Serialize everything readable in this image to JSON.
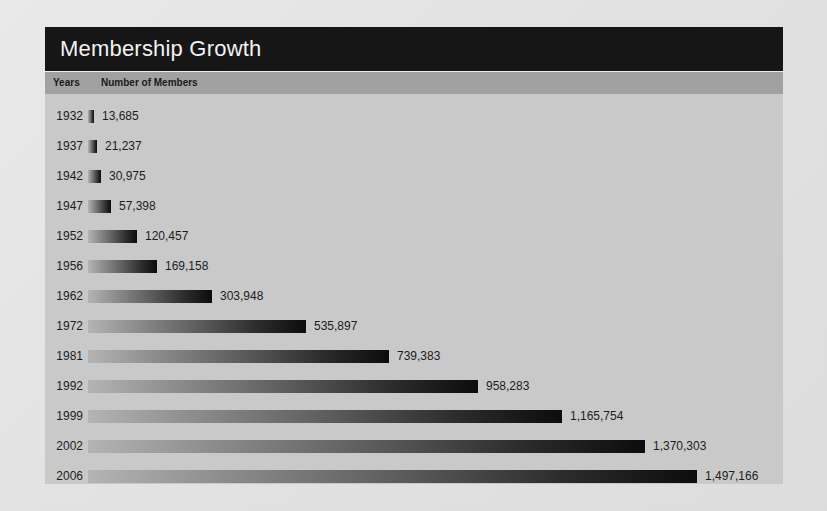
{
  "page": {
    "background_color": "#e6e6e6",
    "panel_color": "#c9c9c9",
    "title_bar_color": "#161616",
    "column_header_color": "#a1a1a1",
    "bar_gradient_start": "#b4b4b4",
    "bar_gradient_end": "#0c0c0c",
    "text_color": "#1c1c1c"
  },
  "header": {
    "title": "Membership Growth"
  },
  "columns": {
    "years": "Years",
    "members": "Number of Members"
  },
  "chart_data": {
    "type": "bar",
    "orientation": "horizontal",
    "title": "Membership Growth",
    "xlabel": "Number of Members",
    "ylabel": "Years",
    "grid": false,
    "legend": false,
    "xlim": [
      0,
      1497166
    ],
    "categories": [
      "1932",
      "1937",
      "1942",
      "1947",
      "1952",
      "1956",
      "1962",
      "1972",
      "1981",
      "1992",
      "1999",
      "2002",
      "2006"
    ],
    "values": [
      13685,
      21237,
      30975,
      57398,
      120457,
      169158,
      303948,
      535897,
      739383,
      958283,
      1165754,
      1370303,
      1497166
    ],
    "value_labels": [
      "13,685",
      "21,237",
      "30,975",
      "57,398",
      "120,457",
      "169,158",
      "303,948",
      "535,897",
      "739,383",
      "958,283",
      "1,165,754",
      "1,370,303",
      "1,497,166"
    ],
    "rows": [
      {
        "year": "1932",
        "value": 13685,
        "label": "13,685"
      },
      {
        "year": "1937",
        "value": 21237,
        "label": "21,237"
      },
      {
        "year": "1942",
        "value": 30975,
        "label": "30,975"
      },
      {
        "year": "1947",
        "value": 57398,
        "label": "57,398"
      },
      {
        "year": "1952",
        "value": 120457,
        "label": "120,457"
      },
      {
        "year": "1956",
        "value": 169158,
        "label": "169,158"
      },
      {
        "year": "1962",
        "value": 303948,
        "label": "303,948"
      },
      {
        "year": "1972",
        "value": 535897,
        "label": "535,897"
      },
      {
        "year": "1981",
        "value": 739383,
        "label": "739,383"
      },
      {
        "year": "1992",
        "value": 958283,
        "label": "958,283"
      },
      {
        "year": "1999",
        "value": 1165754,
        "label": "1,165,754"
      },
      {
        "year": "2002",
        "value": 1370303,
        "label": "1,370,303"
      },
      {
        "year": "2006",
        "value": 1497166,
        "label": "1,497,166"
      }
    ]
  }
}
